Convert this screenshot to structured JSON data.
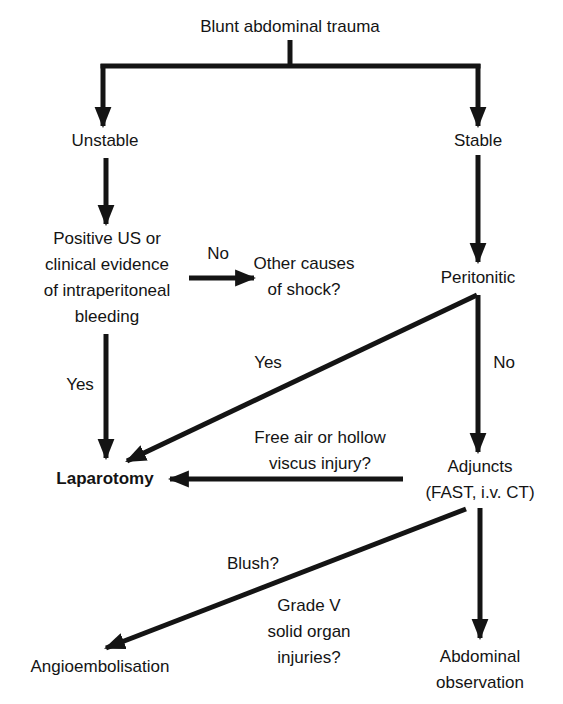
{
  "diagram": {
    "type": "flowchart",
    "title": "Blunt abdominal trauma",
    "nodes": {
      "root": "Blunt abdominal trauma",
      "unstable": "Unstable",
      "stable": "Stable",
      "positive_us": "Positive US or\nclinical evidence\nof intraperitoneal\nbleeding",
      "other_causes": "Other causes\nof shock?",
      "peritonitic": "Peritonitic",
      "laparotomy": "Laparotomy",
      "adjuncts": "Adjuncts\n(FAST, i.v. CT)",
      "angioembolisation": "Angioembolisation",
      "observation": "Abdominal\nobservation"
    },
    "edge_labels": {
      "no_other_causes": "No",
      "yes_laparotomy_left": "Yes",
      "yes_peritonitic": "Yes",
      "no_peritonitic": "No",
      "free_air": "Free air or hollow\nviscus injury?",
      "blush": "Blush?",
      "grade_v": "Grade V\nsolid organ\ninjuries?"
    },
    "edges": [
      {
        "from": "root",
        "to": "unstable"
      },
      {
        "from": "root",
        "to": "stable"
      },
      {
        "from": "unstable",
        "to": "positive_us"
      },
      {
        "from": "positive_us",
        "to": "other_causes",
        "label": "No"
      },
      {
        "from": "positive_us",
        "to": "laparotomy",
        "label": "Yes"
      },
      {
        "from": "stable",
        "to": "peritonitic"
      },
      {
        "from": "peritonitic",
        "to": "laparotomy",
        "label": "Yes"
      },
      {
        "from": "peritonitic",
        "to": "adjuncts",
        "label": "No"
      },
      {
        "from": "adjuncts",
        "to": "laparotomy",
        "label": "Free air or hollow viscus injury?"
      },
      {
        "from": "adjuncts",
        "to": "angioembolisation",
        "label": "Blush? / Grade V solid organ injuries?"
      },
      {
        "from": "adjuncts",
        "to": "observation"
      }
    ],
    "colors": {
      "ink": "#141414",
      "background": "#ffffff"
    }
  }
}
